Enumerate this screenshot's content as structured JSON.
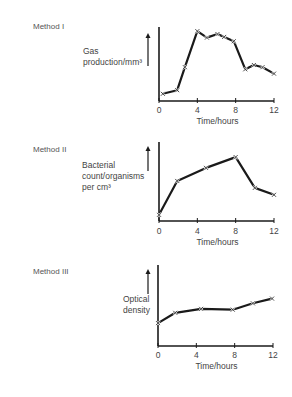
{
  "chart_data": [
    {
      "type": "line",
      "title": "Method I",
      "xlabel": "Time/hours",
      "ylabel": "Gas production/mm³",
      "ylabel_lines": [
        "Gas",
        "production/mm³"
      ],
      "x_ticks": [
        0,
        4,
        8,
        12
      ],
      "xlim": [
        0,
        12
      ],
      "ylim": [
        0,
        10
      ],
      "y_units": "arbitrary (no numeric y-axis ticks shown)",
      "grid": false,
      "marker": "x",
      "x": [
        0.4,
        1.9,
        2.7,
        4.0,
        5.0,
        6.1,
        6.8,
        7.8,
        9.0,
        9.9,
        10.8,
        12.0
      ],
      "values": [
        1.0,
        1.5,
        4.7,
        9.7,
        8.8,
        9.3,
        8.9,
        8.3,
        4.4,
        5.0,
        4.7,
        3.8
      ]
    },
    {
      "type": "line",
      "title": "Method II",
      "xlabel": "Time/hours",
      "ylabel": "Bacterial count/organisms per cm³",
      "ylabel_lines": [
        "Bacterial",
        "count/organisms",
        "per cm³"
      ],
      "x_ticks": [
        0,
        4,
        8,
        12
      ],
      "xlim": [
        0,
        12
      ],
      "ylim": [
        0,
        10
      ],
      "y_units": "arbitrary (no numeric y-axis ticks shown)",
      "grid": false,
      "marker": "x",
      "x": [
        0.0,
        1.9,
        4.9,
        8.0,
        10.0,
        12.0
      ],
      "values": [
        0.8,
        5.2,
        6.9,
        8.3,
        4.3,
        3.4
      ]
    },
    {
      "type": "line",
      "title": "Method III",
      "xlabel": "Time/hours",
      "ylabel": "Optical density",
      "ylabel_lines": [
        "Optical",
        "density"
      ],
      "x_ticks": [
        0,
        4,
        8,
        12
      ],
      "xlim": [
        0,
        12
      ],
      "ylim": [
        0,
        10
      ],
      "y_units": "arbitrary (no numeric y-axis ticks shown)",
      "grid": false,
      "marker": "x",
      "x": [
        0.0,
        1.8,
        4.5,
        7.8,
        9.9,
        11.9
      ],
      "values": [
        2.9,
        4.2,
        4.7,
        4.6,
        5.4,
        6.0
      ]
    }
  ],
  "panels": [
    {
      "method_label": "Method I",
      "ylabel_lines": [
        "Gas",
        "production/mm³"
      ],
      "xlabel": "Time/hours",
      "x_tick_labels": [
        "0",
        "4",
        "8",
        "12"
      ]
    },
    {
      "method_label": "Method II",
      "ylabel_lines": [
        "Bacterial",
        "count/organisms",
        "per cm³"
      ],
      "xlabel": "Time/hours",
      "x_tick_labels": [
        "0",
        "4",
        "8",
        "12"
      ]
    },
    {
      "method_label": "Method III",
      "ylabel_lines": [
        "Optical",
        "density"
      ],
      "xlabel": "Time/hours",
      "x_tick_labels": [
        "0",
        "4",
        "8",
        "12"
      ]
    }
  ],
  "style": {
    "line_color": "#1a1a1a",
    "text_color": "#444444",
    "background": "#ffffff"
  }
}
